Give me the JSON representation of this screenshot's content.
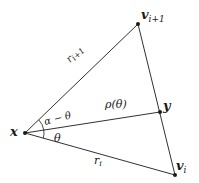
{
  "diagram": {
    "points": {
      "x": {
        "label": "x",
        "pos": [
          25,
          133
        ]
      },
      "v_next": {
        "label": "v",
        "sub": "i+1",
        "pos": [
          138,
          24
        ]
      },
      "y": {
        "label": "y",
        "pos": [
          160,
          112
        ]
      },
      "v_i": {
        "label": "v",
        "sub": "i",
        "pos": [
          175,
          175
        ]
      }
    },
    "edges": [
      {
        "from": "x",
        "to": "v_next",
        "label": "r",
        "sub": "i+1"
      },
      {
        "from": "x",
        "to": "v_i",
        "label": "r",
        "sub": "i"
      },
      {
        "from": "x",
        "to": "y",
        "label": "ρ(θ)"
      },
      {
        "from": "v_next",
        "to": "v_i",
        "label": ""
      }
    ],
    "angles": {
      "upper": "α − θ",
      "lower": "θ"
    },
    "colors": {
      "stroke": "#1a1a1a",
      "background": "#ffffff"
    }
  }
}
